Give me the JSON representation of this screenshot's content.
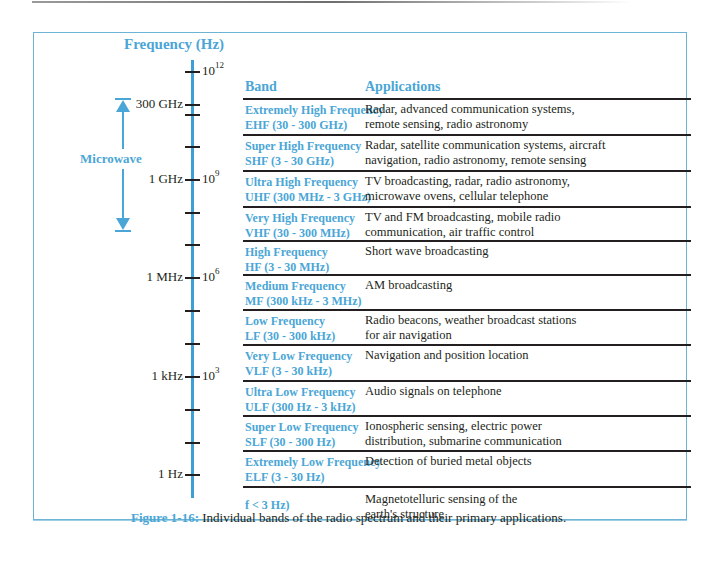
{
  "figure": {
    "axis_title": "Frequency (Hz)",
    "axis_ticks": [
      {
        "left_label": "",
        "right_label": "10",
        "exponent": "12",
        "y": 72
      },
      {
        "left_label": "300 GHz",
        "right_label": "",
        "exponent": "",
        "y": 105
      },
      {
        "left_label": "",
        "right_label": "",
        "exponent": "",
        "y": 115
      },
      {
        "left_label": "",
        "right_label": "",
        "exponent": "",
        "y": 147
      },
      {
        "left_label": "1 GHz",
        "right_label": "10",
        "exponent": "9",
        "y": 180
      },
      {
        "left_label": "",
        "right_label": "",
        "exponent": "",
        "y": 213
      },
      {
        "left_label": "",
        "right_label": "",
        "exponent": "",
        "y": 245
      },
      {
        "left_label": "1 MHz",
        "right_label": "10",
        "exponent": "6",
        "y": 278
      },
      {
        "left_label": "",
        "right_label": "",
        "exponent": "",
        "y": 311
      },
      {
        "left_label": "",
        "right_label": "",
        "exponent": "",
        "y": 344
      },
      {
        "left_label": "1 kHz",
        "right_label": "10",
        "exponent": "3",
        "y": 377
      },
      {
        "left_label": "",
        "right_label": "",
        "exponent": "",
        "y": 410
      },
      {
        "left_label": "",
        "right_label": "",
        "exponent": "",
        "y": 443
      },
      {
        "left_label": "1 Hz",
        "right_label": "",
        "exponent": "",
        "y": 475
      }
    ],
    "microwave_label": "Microwave",
    "table": {
      "headers": {
        "band": "Band",
        "applications": "Applications"
      },
      "rows": [
        {
          "band_name": "Extremely High Frequency",
          "band_range": "EHF (30 - 300 GHz)",
          "app_line1": "Radar, advanced communication systems,",
          "app_line2": "remote sensing, radio astronomy",
          "height": 34
        },
        {
          "band_name": "Super High Frequency",
          "band_range": "SHF (3 - 30 GHz)",
          "app_line1": "Radar, satellite communication systems, aircraft",
          "app_line2": "navigation, radio astronomy, remote sensing",
          "height": 34
        },
        {
          "band_name": "Ultra High Frequency",
          "band_range": "UHF (300 MHz - 3 GHz)",
          "app_line1": "TV broadcasting, radar, radio astronomy,",
          "app_line2": "microwave ovens, cellular telephone",
          "height": 34
        },
        {
          "band_name": "Very High Frequency",
          "band_range": "VHF (30 - 300 MHz)",
          "app_line1": "TV and FM broadcasting, mobile radio",
          "app_line2": "communication, air traffic control",
          "height": 32
        },
        {
          "band_name": "High Frequency",
          "band_range": "HF (3 - 30 MHz)",
          "app_line1": "Short wave broadcasting",
          "app_line2": "",
          "height": 32
        },
        {
          "band_name": "Medium Frequency",
          "band_range": "MF (300 kHz - 3 MHz)",
          "app_line1": "AM broadcasting",
          "app_line2": "",
          "height": 33
        },
        {
          "band_name": "Low Frequency",
          "band_range": "LF (30 - 300 kHz)",
          "app_line1": "Radio beacons, weather broadcast stations",
          "app_line2": "for air navigation",
          "height": 33
        },
        {
          "band_name": "Very Low Frequency",
          "band_range": "VLF (3 - 30 kHz)",
          "app_line1": "Navigation and position location",
          "app_line2": "",
          "height": 34
        },
        {
          "band_name": "Ultra Low Frequency",
          "band_range": "ULF (300 Hz - 3 kHz)",
          "app_line1": "Audio signals on telephone",
          "app_line2": "",
          "height": 33
        },
        {
          "band_name": "Super Low Frequency",
          "band_range": "SLF (30 - 300 Hz)",
          "app_line1": "Ionospheric sensing, electric power",
          "app_line2": "distribution, submarine communication",
          "height": 33
        },
        {
          "band_name": "Extremely Low Frequency",
          "band_range": "ELF (3 - 30 Hz)",
          "app_line1": "Detection of buried metal objects",
          "app_line2": "",
          "height": 34
        },
        {
          "band_name": "",
          "band_range": "f < 3 Hz)",
          "app_line1": "Magnetotelluric sensing of the",
          "app_line2": "earth's structure",
          "height": 36
        }
      ]
    },
    "caption": {
      "label": "Figure 1-16:",
      "text": " Individual bands of the radio spectrum and their primary applications."
    }
  },
  "colors": {
    "accent_blue": "#4aa6d6",
    "axis_blue": "#3d9fd6",
    "frame_blue": "#6cb4d4",
    "text": "#231f20"
  }
}
